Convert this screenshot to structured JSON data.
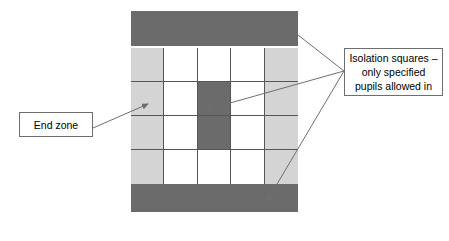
{
  "diagram": {
    "type": "playground-zoning-diagram",
    "title_text_present": false,
    "pitch": {
      "name": "playground-layout",
      "bands": [
        {
          "position": "top",
          "color": "#6b6b6b",
          "meaning": "end zone band"
        },
        {
          "position": "bottom",
          "color": "#6b6b6b",
          "meaning": "end zone band"
        }
      ],
      "grid": {
        "columns": 5,
        "rows": 4,
        "line_color": "#555555",
        "colors": {
          "white": "#ffffff",
          "light": "#d4d4d4",
          "dark": "#6b6b6b"
        },
        "cells": [
          [
            "light",
            "white",
            "white",
            "white",
            "light"
          ],
          [
            "light",
            "white",
            "dark",
            "white",
            "light"
          ],
          [
            "light",
            "white",
            "dark",
            "white",
            "light"
          ],
          [
            "light",
            "white",
            "white",
            "white",
            "light"
          ]
        ]
      }
    },
    "callouts": [
      {
        "id": "end-zone",
        "lines": [
          "End zone"
        ],
        "points_to": "left light-grey column"
      },
      {
        "id": "isolation-squares",
        "lines": [
          "Isolation squares –",
          "only specified",
          "pupils allowed in"
        ],
        "points_to": "dark shaded squares and end bands"
      }
    ],
    "connector_color": "#6e6e6e"
  }
}
